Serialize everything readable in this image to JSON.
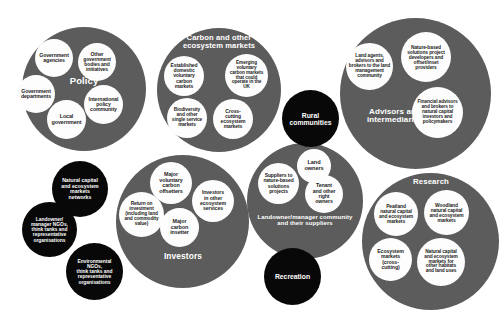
{
  "diagram": {
    "colors": {
      "cluster_gray": "#5c5c5c",
      "cluster_black": "#080808",
      "node_fill": "#fdfdfd",
      "node_text": "#242424",
      "label_text": "#ffffff",
      "background": "#ffffff"
    }
  },
  "clusters": [
    {
      "id": "policy",
      "label": "Policy",
      "type": "gray",
      "x": 22,
      "y": 27,
      "d": 124,
      "label_x": 42,
      "label_y": 76,
      "label_w": 84,
      "label_size": 9.5,
      "nodes": [
        {
          "text": "Government\nagencies",
          "x": 35,
          "y": 39,
          "d": 38,
          "size": 5.2
        },
        {
          "text": "Other\ngovernment\nbodies and\ninitiatives",
          "x": 78,
          "y": 43,
          "d": 38,
          "size": 5.0
        },
        {
          "text": "Government\ndepartments",
          "x": 17,
          "y": 75,
          "d": 38,
          "size": 5.2
        },
        {
          "text": "International\npolicy\ncommunity",
          "x": 84,
          "y": 85,
          "d": 39,
          "size": 5.2
        },
        {
          "text": "Local\ngovernment",
          "x": 47,
          "y": 100,
          "d": 39,
          "size": 5.4
        }
      ]
    },
    {
      "id": "carbon-markets",
      "label": "Carbon and other\necosystem markets",
      "type": "gray",
      "x": 157,
      "y": 28,
      "d": 124,
      "label_x": 168,
      "label_y": 34,
      "label_w": 102,
      "label_size": 7.6,
      "nodes": [
        {
          "text": "Established\ndomestic\nvoluntary\ncarbon\nmarkets",
          "x": 164,
          "y": 56,
          "d": 40,
          "size": 5.0
        },
        {
          "text": "Emerging\nvoluntary\ncarbon markets\nthat could\noperate in the\nUK",
          "x": 225,
          "y": 54,
          "d": 43,
          "size": 4.7
        },
        {
          "text": "Biodiversity\nand other\nsingle service\nmarkets",
          "x": 167,
          "y": 98,
          "d": 40,
          "size": 4.8
        },
        {
          "text": "Cross-\ncutting\necosystem\nmarkets",
          "x": 213,
          "y": 99,
          "d": 40,
          "size": 5.0
        }
      ]
    },
    {
      "id": "advisors",
      "label": "Advisors and\nintermediaries",
      "type": "gray",
      "x": 340,
      "y": 18,
      "d": 151,
      "label_x": 349,
      "label_y": 108,
      "label_w": 92,
      "label_size": 8.0,
      "nodes": [
        {
          "text": "Land agents,\nadvisors and\nbrokers to the land\nmanagement\ncommunity",
          "x": 346,
          "y": 43,
          "d": 47,
          "size": 4.8
        },
        {
          "text": "Nature-based\nsolutions project\ndevelopers and\noffset/inset\nproviders",
          "x": 401,
          "y": 32,
          "d": 50,
          "size": 4.9
        },
        {
          "text": "Financial advisors\nand brokers to\nnatural capital\ninvestors and\npolicymakers",
          "x": 412,
          "y": 87,
          "d": 51,
          "size": 4.8
        }
      ]
    },
    {
      "id": "investors",
      "label": "Investors",
      "type": "gray",
      "x": 116,
      "y": 155,
      "d": 133,
      "label_x": 148,
      "label_y": 252,
      "label_w": 70,
      "label_size": 8.4,
      "nodes": [
        {
          "text": "Major\nvoluntary\ncarbon\noffsetters",
          "x": 150,
          "y": 162,
          "d": 42,
          "size": 5.4
        },
        {
          "text": "Investors\nin other\necosystem\nservices",
          "x": 192,
          "y": 180,
          "d": 42,
          "size": 5.2
        },
        {
          "text": "Return on\ninvestment\n(including land\nand commodity\nvalue)",
          "x": 119,
          "y": 192,
          "d": 45,
          "size": 4.8
        },
        {
          "text": "Major\ncarbon\ninsetter",
          "x": 160,
          "y": 208,
          "d": 39,
          "size": 5.4
        }
      ]
    },
    {
      "id": "landowner-community",
      "label": "Landowner/manager community\nand their suppliers",
      "type": "gray",
      "x": 247,
      "y": 143,
      "d": 116,
      "label_x": 249,
      "label_y": 214,
      "label_w": 112,
      "label_size": 6.0,
      "nodes": [
        {
          "text": "Land\nowners",
          "x": 297,
          "y": 149,
          "d": 34,
          "size": 5.6
        },
        {
          "text": "Suppliers to\nnature-based\nsolutions\nprojects",
          "x": 258,
          "y": 163,
          "d": 41,
          "size": 5.0
        },
        {
          "text": "Tenant\nand other\nright\nowners",
          "x": 305,
          "y": 175,
          "d": 38,
          "size": 5.2
        }
      ]
    },
    {
      "id": "research",
      "label": "Research",
      "type": "gray",
      "x": 362,
      "y": 173,
      "d": 137,
      "label_x": 398,
      "label_y": 178,
      "label_w": 66,
      "label_size": 7.8,
      "nodes": [
        {
          "text": "Peatland\nnatural capital\nand ecosystem\nmarkets",
          "x": 374,
          "y": 192,
          "d": 44,
          "size": 4.9
        },
        {
          "text": "Woodland\nnatural capital\nand ecosystem\nmarkets",
          "x": 424,
          "y": 190,
          "d": 45,
          "size": 4.9
        },
        {
          "text": "Ecosystem\nmarkets\n(cross-\ncutting)",
          "x": 369,
          "y": 238,
          "d": 43,
          "size": 5.2
        },
        {
          "text": "Natural capital\nand ecosystem\nmarkets for\nother habitats\nand land uses",
          "x": 417,
          "y": 238,
          "d": 48,
          "size": 4.8
        }
      ]
    },
    {
      "id": "rural-communities",
      "label": "Rural\ncommunities",
      "type": "black",
      "x": 282,
      "y": 90,
      "d": 57,
      "label_size": 6.8,
      "nodes": []
    },
    {
      "id": "natural-capital-networks",
      "label": "Natural capital\nand ecosystem\nmarkets\nnetworks",
      "type": "black",
      "x": 52,
      "y": 161,
      "d": 56,
      "label_size": 5.2,
      "nodes": []
    },
    {
      "id": "landowner-ngos",
      "label": "Landowner/\nmanager NGOs,\nthink tanks and\nrepresentative\norganisations",
      "type": "black",
      "x": 22,
      "y": 202,
      "d": 55,
      "label_size": 4.9,
      "nodes": []
    },
    {
      "id": "environmental-ngos",
      "label": "Environmental\nNGOs,\nthink tanks and\nrepresentative\norganisations",
      "type": "black",
      "x": 66,
      "y": 243,
      "d": 57,
      "label_size": 4.9,
      "nodes": []
    },
    {
      "id": "recreation",
      "label": "Recreation",
      "type": "black",
      "x": 264,
      "y": 248,
      "d": 57,
      "label_size": 6.8,
      "nodes": []
    }
  ]
}
